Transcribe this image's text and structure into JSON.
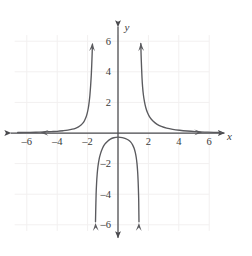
{
  "figure": {
    "background_color": "#ffffff",
    "curve_color": "#5a5a5e",
    "axis_color": "#4a4a4e",
    "grid_color": "#f2f0f0",
    "label_color": "#3a3a3a"
  },
  "chart_data": {
    "type": "line",
    "title": "",
    "subtitle": "",
    "xlabel": "x",
    "ylabel": "y",
    "xlim": [
      -7.2,
      7.2
    ],
    "ylim": [
      -7.0,
      7.0
    ],
    "grid": true,
    "grid_spacing": 2,
    "grid_extent": {
      "x": [
        -6.8,
        6.0
      ],
      "y": [
        -6.4,
        6.4
      ]
    },
    "legend": "none",
    "xticks": [
      -6,
      -4,
      -2,
      2,
      4,
      6
    ],
    "xtick_labels": [
      "–6",
      "–4",
      "–2",
      "2",
      "4",
      "6"
    ],
    "yticks": [
      -6,
      -4,
      -2,
      2,
      4,
      6
    ],
    "ytick_labels": [
      "–6",
      "–4",
      "–2",
      "2",
      "4",
      "6"
    ],
    "asymptotes": {
      "vertical": [
        -1.62,
        1.42
      ],
      "horizontal": [
        0
      ]
    },
    "annotations": [
      "Left branch rises to +infinity approaching x = -1.6 from the left",
      "Right branch rises to +infinity approaching x = 1.4 from the right",
      "Middle branch peaks near (0, -0.25) and falls to -infinity at both asymptotes"
    ],
    "series": [
      {
        "name": "left-branch",
        "points": [
          [
            -6.6,
            -0.03
          ],
          [
            -6.0,
            -0.04
          ],
          [
            -5.4,
            -0.05
          ],
          [
            -4.8,
            -0.07
          ],
          [
            -4.4,
            -0.09
          ],
          [
            -4.0,
            -0.11
          ],
          [
            -3.6,
            -0.15
          ],
          [
            -3.3,
            -0.19
          ],
          [
            -3.0,
            -0.25
          ],
          [
            -2.8,
            -0.31
          ],
          [
            -2.6,
            -0.4
          ],
          [
            -2.45,
            -0.5
          ],
          [
            -2.3,
            -0.66
          ],
          [
            -2.2,
            -0.82
          ],
          [
            -2.1,
            -1.05
          ],
          [
            -2.02,
            -1.32
          ],
          [
            -1.95,
            -1.65
          ],
          [
            -1.9,
            -2.0
          ],
          [
            -1.85,
            -2.45
          ],
          [
            -1.8,
            -3.1
          ],
          [
            -1.76,
            -3.75
          ],
          [
            -1.73,
            -4.4
          ],
          [
            -1.7,
            -5.2
          ],
          [
            -1.68,
            -5.8
          ]
        ],
        "arrow_start": [
          -5.1,
          -0.035
        ],
        "arrow_end": [
          -1.68,
          5.85
        ]
      },
      {
        "name": "middle-branch",
        "points": [
          [
            -1.48,
            -5.8
          ],
          [
            -1.46,
            -4.8
          ],
          [
            -1.44,
            -4.0
          ],
          [
            -1.41,
            -3.3
          ],
          [
            -1.37,
            -2.7
          ],
          [
            -1.32,
            -2.2
          ],
          [
            -1.25,
            -1.75
          ],
          [
            -1.15,
            -1.35
          ],
          [
            -1.02,
            -1.0
          ],
          [
            -0.88,
            -0.75
          ],
          [
            -0.7,
            -0.55
          ],
          [
            -0.5,
            -0.4
          ],
          [
            -0.28,
            -0.31
          ],
          [
            0.0,
            -0.27
          ],
          [
            0.28,
            -0.3
          ],
          [
            0.5,
            -0.36
          ],
          [
            0.68,
            -0.46
          ],
          [
            0.84,
            -0.6
          ],
          [
            0.96,
            -0.78
          ],
          [
            1.06,
            -1.0
          ],
          [
            1.14,
            -1.28
          ],
          [
            1.2,
            -1.6
          ],
          [
            1.25,
            -2.0
          ],
          [
            1.29,
            -2.5
          ],
          [
            1.32,
            -3.05
          ],
          [
            1.34,
            -3.6
          ],
          [
            1.36,
            -4.3
          ],
          [
            1.37,
            -5.0
          ],
          [
            1.38,
            -5.8
          ]
        ],
        "arrow_start": [
          -1.48,
          -5.85
        ],
        "arrow_end": [
          1.38,
          -5.85
        ]
      },
      {
        "name": "right-branch",
        "points": [
          [
            1.5,
            5.85
          ],
          [
            1.52,
            5.1
          ],
          [
            1.55,
            4.3
          ],
          [
            1.58,
            3.6
          ],
          [
            1.62,
            3.0
          ],
          [
            1.67,
            2.5
          ],
          [
            1.74,
            2.05
          ],
          [
            1.83,
            1.65
          ],
          [
            1.95,
            1.3
          ],
          [
            2.1,
            1.02
          ],
          [
            2.3,
            0.78
          ],
          [
            2.55,
            0.58
          ],
          [
            2.85,
            0.43
          ],
          [
            3.2,
            0.32
          ],
          [
            3.6,
            0.24
          ],
          [
            4.05,
            0.18
          ],
          [
            4.55,
            0.13
          ],
          [
            5.1,
            0.09
          ],
          [
            5.7,
            0.06
          ],
          [
            6.3,
            0.04
          ],
          [
            6.8,
            0.03
          ]
        ],
        "arrow_start": [
          1.5,
          5.85
        ],
        "arrow_end": [
          5.55,
          0.055
        ]
      }
    ]
  }
}
